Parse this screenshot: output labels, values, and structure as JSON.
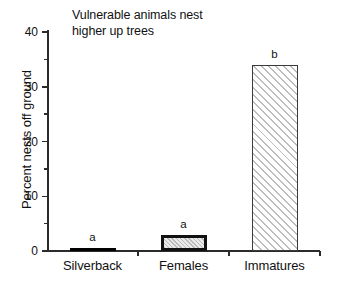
{
  "chart_data": {
    "type": "bar",
    "title": "Vulnerable animals nest\nhigher up trees",
    "xlabel": "",
    "ylabel": "Percent nests off ground",
    "categories": [
      "Silverback",
      "Females",
      "Immatures"
    ],
    "values": [
      0.5,
      3,
      34
    ],
    "annotations": [
      "a",
      "a",
      "b"
    ],
    "ylim": [
      0,
      40
    ],
    "yticks": [
      0,
      10,
      20,
      30,
      40
    ],
    "ytick_labels": [
      "0",
      "10",
      "20",
      "30",
      "40"
    ],
    "yminor_ticks": [
      5,
      15,
      25,
      35
    ],
    "grid": false,
    "legend": false,
    "bar_styles": [
      "solid-black",
      "stipple",
      "hatch"
    ],
    "colors": {
      "axis": "#2b2b2b",
      "text": "#111111",
      "bar_silverback_fill": "#000000",
      "bar_females_fill": "#e9e9e9",
      "bar_females_edge": "#111111",
      "bar_immatures_fill": "#fbfbfb",
      "bar_immatures_hatch": "#bdbdbd",
      "background": "#ffffff"
    }
  }
}
